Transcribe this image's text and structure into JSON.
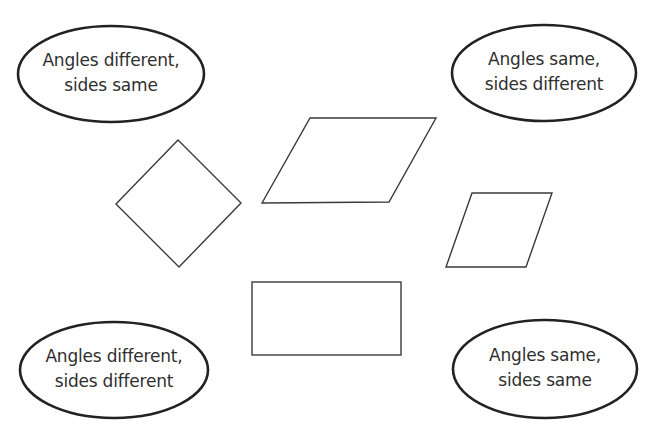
{
  "diagram": {
    "type": "sorting-activity",
    "categories": [
      {
        "id": "angles-different-sides-same",
        "position": "top-left",
        "line1": "Angles different,",
        "line2": "sides same",
        "ellipse": {
          "cx": 111,
          "cy": 74,
          "rx": 93,
          "ry": 48
        }
      },
      {
        "id": "angles-same-sides-different",
        "position": "top-right",
        "line1": "Angles same,",
        "line2": "sides different",
        "ellipse": {
          "cx": 544,
          "cy": 73,
          "rx": 92,
          "ry": 48
        }
      },
      {
        "id": "angles-different-sides-different",
        "position": "bottom-left",
        "line1": "Angles different,",
        "line2": "sides different",
        "ellipse": {
          "cx": 114,
          "cy": 370,
          "rx": 94,
          "ry": 48
        }
      },
      {
        "id": "angles-same-sides-same",
        "position": "bottom-right",
        "line1": "Angles same,",
        "line2": "sides same",
        "ellipse": {
          "cx": 545,
          "cy": 369,
          "rx": 92,
          "ry": 49
        }
      }
    ],
    "shapes": [
      {
        "id": "square-diamond",
        "kind": "square (rotated)",
        "points": "178,140 241,203 179,267 116,204"
      },
      {
        "id": "large-rhombus",
        "kind": "parallelogram",
        "points": "310,118 436,118 389,202 262,203"
      },
      {
        "id": "small-rhombus",
        "kind": "rhombus",
        "points": "472,193 552,193 526,267 446,267"
      },
      {
        "id": "rectangle",
        "kind": "rectangle",
        "x": 252,
        "y": 282,
        "width": 149,
        "height": 73
      }
    ],
    "colors": {
      "background": "#ffffff",
      "ellipse_stroke": "#222222",
      "shape_stroke": "#3a3a3a",
      "text": "#2f2f2f"
    }
  }
}
